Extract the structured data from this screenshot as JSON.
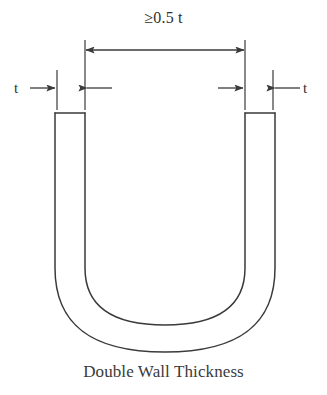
{
  "figure": {
    "caption": "Double Wall Thickness",
    "background_color": "#ffffff",
    "stroke_color": "#3a3a3a",
    "text_color": "#2f2f2f"
  },
  "annotations": {
    "inner_width_label": "≥0.5 t",
    "left_thickness_label": "t",
    "right_thickness_label": "t"
  },
  "icons": {
    "dimension_arrow_left": "arrow-left-icon",
    "dimension_arrow_right": "arrow-right-icon",
    "left_thickness_arrow_in": "arrow-right-icon",
    "left_thickness_arrow_out": "arrow-left-icon",
    "right_thickness_arrow_in": "arrow-left-icon",
    "right_thickness_arrow_out": "arrow-right-icon"
  },
  "geometry": {
    "outer_left_x": 55,
    "outer_right_x": 275,
    "inner_left_x": 85,
    "inner_right_x": 245,
    "wall_top_y": 113,
    "outer_bottom_y": 352,
    "inner_bottom_y": 325,
    "wall_thickness": 30,
    "main_dimension_y": 50,
    "thickness_dimension_y": 88
  }
}
